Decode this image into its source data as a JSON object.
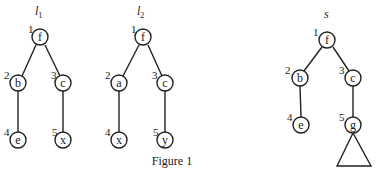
{
  "figure": {
    "caption": "Figure 1",
    "trees": [
      {
        "name": "l1",
        "title_main": "l",
        "title_sub": "1",
        "nodes": [
          {
            "id": 1,
            "label": "f",
            "number": "1",
            "x": 40,
            "y": 37
          },
          {
            "id": 2,
            "label": "b",
            "number": "2",
            "x": 18,
            "y": 83
          },
          {
            "id": 3,
            "label": "c",
            "number": "3",
            "x": 63,
            "y": 83
          },
          {
            "id": 4,
            "label": "e",
            "number": "4",
            "x": 18,
            "y": 140
          },
          {
            "id": 5,
            "label": "x",
            "number": "5",
            "x": 63,
            "y": 140
          }
        ],
        "edges": [
          [
            1,
            2
          ],
          [
            1,
            3
          ],
          [
            2,
            4
          ],
          [
            3,
            5
          ]
        ]
      },
      {
        "name": "l2",
        "title_main": "l",
        "title_sub": "2",
        "nodes": [
          {
            "id": 1,
            "label": "f",
            "number": "1",
            "x": 143,
            "y": 37
          },
          {
            "id": 2,
            "label": "a",
            "number": "2",
            "x": 119,
            "y": 83
          },
          {
            "id": 3,
            "label": "c",
            "number": "3",
            "x": 165,
            "y": 83
          },
          {
            "id": 4,
            "label": "x",
            "number": "4",
            "x": 119,
            "y": 140
          },
          {
            "id": 5,
            "label": "y",
            "number": "5",
            "x": 165,
            "y": 140
          }
        ],
        "edges": [
          [
            1,
            2
          ],
          [
            1,
            3
          ],
          [
            2,
            4
          ],
          [
            3,
            5
          ]
        ]
      },
      {
        "name": "s",
        "title_main": "s",
        "title_sub": "",
        "nodes": [
          {
            "id": 1,
            "label": "f",
            "number": "1",
            "x": 327,
            "y": 40
          },
          {
            "id": 2,
            "label": "b",
            "number": "2",
            "x": 300,
            "y": 78
          },
          {
            "id": 3,
            "label": "c",
            "number": "3",
            "x": 353,
            "y": 78
          },
          {
            "id": 4,
            "label": "e",
            "number": "4",
            "x": 301,
            "y": 125
          },
          {
            "id": 5,
            "label": "g",
            "number": "5",
            "x": 353,
            "y": 125
          }
        ],
        "edges": [
          [
            1,
            2
          ],
          [
            1,
            3
          ],
          [
            2,
            4
          ],
          [
            3,
            5
          ]
        ],
        "subtree_triangle_under": 5
      }
    ]
  }
}
